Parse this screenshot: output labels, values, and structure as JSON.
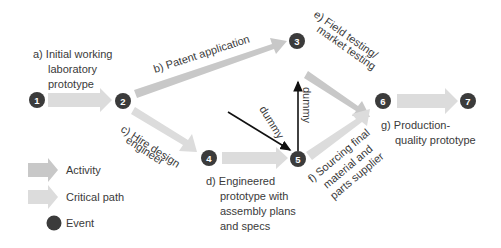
{
  "colors": {
    "activity": "#c8c8c8",
    "critical": "#dcdcdc",
    "event": "#3b3b3b",
    "dummy": "#111111",
    "text": "#3a3a3a"
  },
  "events": [
    {
      "id": "1",
      "label": "1"
    },
    {
      "id": "2",
      "label": "2"
    },
    {
      "id": "3",
      "label": "3"
    },
    {
      "id": "4",
      "label": "4"
    },
    {
      "id": "5",
      "label": "5"
    },
    {
      "id": "6",
      "label": "6"
    },
    {
      "id": "7",
      "label": "7"
    }
  ],
  "activities": {
    "a": {
      "line1": "a)  Initial working",
      "line2": "laboratory",
      "line3": "prototype"
    },
    "b": {
      "text": "b)  Patent application"
    },
    "c": {
      "line1": "c)  Hire design",
      "line2": "engineer"
    },
    "d": {
      "line1": "d)  Engineered",
      "line2": "prototype with",
      "line3": "assembly plans",
      "line4": "and specs"
    },
    "e": {
      "line1": "e)  Field testing/",
      "line2": "market testing"
    },
    "f": {
      "line1": "f)  Sourcing final",
      "line2": "material and",
      "line3": "parts supplier"
    },
    "g": {
      "line1": "g)  Production-",
      "line2": "quality prototype"
    }
  },
  "dummies": [
    {
      "label": "dummy"
    },
    {
      "label": "dummy"
    }
  ],
  "legend": {
    "activity": "Activity",
    "critical": "Critical path",
    "event": "Event"
  }
}
